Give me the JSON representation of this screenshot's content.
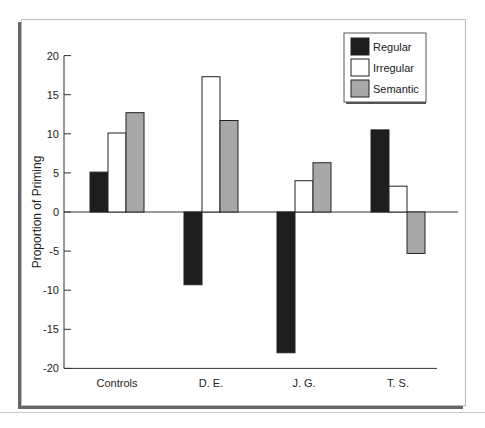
{
  "chart_data": {
    "type": "bar",
    "title": "",
    "xlabel": "",
    "ylabel": "Proportion of Priming",
    "ylim": [
      -20,
      20
    ],
    "yticks": [
      20,
      15,
      10,
      5,
      0,
      -5,
      -10,
      -15,
      -20
    ],
    "categories": [
      "Controls",
      "D. E.",
      "J. G.",
      "T. S."
    ],
    "series": [
      {
        "name": "Regular",
        "color": "#1e1e1e",
        "values": [
          5.1,
          -9.3,
          -18.0,
          10.5
        ]
      },
      {
        "name": "Irregular",
        "color": "#ffffff",
        "values": [
          10.1,
          17.3,
          4.0,
          3.3
        ]
      },
      {
        "name": "Semantic",
        "color": "#a8a8a8",
        "values": [
          12.7,
          11.7,
          6.3,
          -5.3
        ]
      }
    ],
    "grid": false,
    "legend_position": "top-right"
  }
}
